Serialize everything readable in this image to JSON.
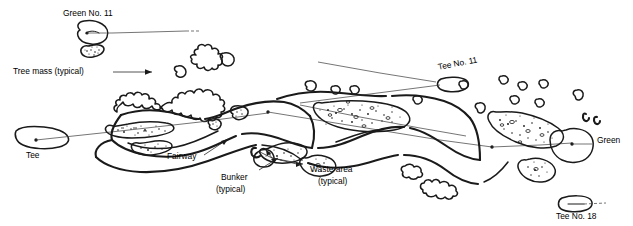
{
  "figure": {
    "type": "hand-drawn golf course routing plan",
    "background_color": "#ffffff",
    "ink_color": "#1a1a1a"
  },
  "labels": {
    "green_no_11": "Green No. 11",
    "tree_mass": "Tree mass (typical)",
    "tee": "Tee",
    "fairway": "Fairway",
    "bunker_line1": "Bunker",
    "bunker_line2": "(typical)",
    "waste_line1": "Waste area",
    "waste_line2": "(typical)",
    "tee_no_11": "Tee No. 11",
    "tee_no_18": "Tee No. 18",
    "green": "Green"
  },
  "features": [
    {
      "name": "green-no-11-shape",
      "kind": "green",
      "label": "Green No. 11"
    },
    {
      "name": "green-no-11-bunker",
      "kind": "bunker"
    },
    {
      "name": "tee-shape-left",
      "kind": "tee",
      "label": "Tee"
    },
    {
      "name": "tree-mass-cluster",
      "kind": "tree-mass",
      "label": "Tree mass (typical)"
    },
    {
      "name": "fairway-corridor",
      "kind": "fairway",
      "label": "Fairway"
    },
    {
      "name": "bunker-cluster",
      "kind": "bunker",
      "label": "Bunker (typical)"
    },
    {
      "name": "waste-area-cluster",
      "kind": "waste-area",
      "label": "Waste area (typical)"
    },
    {
      "name": "tee-no-11-shape",
      "kind": "tee",
      "label": "Tee No. 11"
    },
    {
      "name": "tee-no-18-shape",
      "kind": "tee",
      "label": "Tee No. 18"
    },
    {
      "name": "green-right-shape",
      "kind": "green",
      "label": "Green"
    }
  ]
}
